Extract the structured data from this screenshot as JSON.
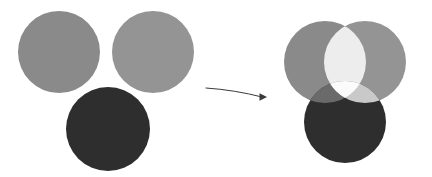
{
  "figure": {
    "width": 432,
    "height": 177,
    "background_color": "#ffffff"
  },
  "colors": {
    "circle_gray_left": "#8a8a8a",
    "circle_gray_right": "#949494",
    "circle_dark": "#2e2e2e",
    "overlap_gray_gray": "#ededed",
    "overlap_triple_center": "#fbfbfb",
    "overlap_gray_dark_left": "#6a6a6a",
    "overlap_gray_dark_right": "#c9c9c9",
    "arrow_color": "#3a3a3a",
    "background": "#ffffff"
  },
  "left_panel": {
    "name": "separated-circles",
    "circles": [
      {
        "id": "left-gray-circle",
        "label": "gray circle A",
        "cx": 59,
        "cy": 52,
        "r": 41,
        "fill": "#8a8a8a"
      },
      {
        "id": "right-gray-circle",
        "label": "gray circle B",
        "cx": 153,
        "cy": 52,
        "r": 41,
        "fill": "#949494"
      },
      {
        "id": "bottom-dark-circle",
        "label": "dark circle C",
        "cx": 108,
        "cy": 129,
        "r": 42,
        "fill": "#2e2e2e"
      }
    ]
  },
  "arrow": {
    "name": "transformation-arrow",
    "start_x": 206,
    "start_y": 88,
    "end_x": 262,
    "end_y": 97,
    "control_x": 235,
    "control_y": 90,
    "color": "#3a3a3a",
    "stroke_width": 1,
    "head_size": 5,
    "direction": "right"
  },
  "right_panel": {
    "name": "overlapping-circles",
    "blend_mode": "lighten",
    "circles": [
      {
        "id": "left-gray-circle-overlap",
        "label": "gray circle A",
        "cx": 325,
        "cy": 62,
        "r": 41,
        "fill": "#8a8a8a"
      },
      {
        "id": "right-gray-circle-overlap",
        "label": "gray circle B",
        "cx": 365,
        "cy": 62,
        "r": 41,
        "fill": "#949494"
      },
      {
        "id": "bottom-dark-circle-overlap",
        "label": "dark circle C",
        "cx": 345,
        "cy": 122,
        "r": 41,
        "fill": "#2e2e2e"
      }
    ],
    "regions": [
      {
        "id": "a-only",
        "label": "A only",
        "fill": "#8a8a8a"
      },
      {
        "id": "b-only",
        "label": "B only",
        "fill": "#949494"
      },
      {
        "id": "c-only",
        "label": "C only",
        "fill": "#2e2e2e"
      },
      {
        "id": "a-b",
        "label": "A and B",
        "fill": "#ededed"
      },
      {
        "id": "a-c",
        "label": "A and C",
        "fill": "#6a6a6a"
      },
      {
        "id": "b-c",
        "label": "B and C",
        "fill": "#c9c9c9"
      },
      {
        "id": "a-b-c",
        "label": "A and B and C",
        "fill": "#fbfbfb"
      }
    ]
  }
}
